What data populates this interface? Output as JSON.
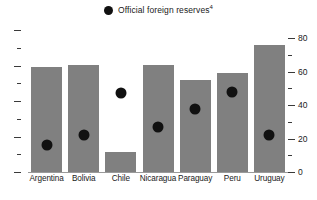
{
  "legend": {
    "marker_name": "filled-circle-marker",
    "label": "Official foreign reserves",
    "footnote": "4",
    "marker_color": "#111111"
  },
  "axis": {
    "right_ticks": [
      "0",
      "20",
      "40",
      "60",
      "80"
    ],
    "left_ticks": [
      "",
      "",
      "",
      "",
      "",
      "",
      "",
      "",
      ""
    ]
  },
  "colors": {
    "bar": "#808080",
    "marker": "#111111",
    "baseline": "#9a9a9a",
    "text": "#1a1a1a",
    "background": "#ffffff"
  },
  "chart_data": {
    "type": "bar",
    "title": "",
    "subtitle": "",
    "xlabel": "",
    "ylabel": "",
    "ylim": [
      0,
      85
    ],
    "grid": false,
    "legend_position": "top-center",
    "categories": [
      "Argentina",
      "Bolivia",
      "Chile",
      "Nicaragua",
      "Paraguay",
      "Peru",
      "Uruguay"
    ],
    "series": [
      {
        "name": "Bars",
        "type": "bar",
        "color": "#808080",
        "values": [
          63,
          64,
          12,
          64,
          55,
          59,
          76
        ]
      },
      {
        "name": "Official foreign reserves",
        "type": "scatter",
        "color": "#111111",
        "marker": "circle",
        "values": [
          16,
          22,
          47,
          27,
          38,
          48,
          22
        ]
      }
    ],
    "y_major_ticks": [
      0,
      20,
      40,
      60,
      80
    ],
    "y_minor_ticks": [
      10,
      30,
      50,
      70
    ]
  }
}
